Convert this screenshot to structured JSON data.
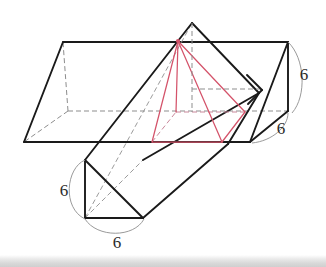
{
  "figure": {
    "colors": {
      "outline": "#1a1a1a",
      "hidden_edge": "#8d8d8d",
      "pyramid": "#d4536a",
      "pyramid_hidden": "#e7a3ae",
      "dimension_arc": "#9a9a9a",
      "label_text": "#2b2b2b",
      "background": "#ffffff",
      "bottom_bar": "#d8d8d8"
    },
    "labels": [
      {
        "id": "right-height",
        "text": "6",
        "x": 304,
        "y": 80
      },
      {
        "id": "right-depth",
        "text": "6",
        "x": 281,
        "y": 134
      },
      {
        "id": "lower-height",
        "text": "6",
        "x": 64,
        "y": 196
      },
      {
        "id": "lower-width",
        "text": "6",
        "x": 117,
        "y": 245
      }
    ],
    "prism_main": {
      "name": "horizontal-triangular-prism",
      "ridge_top_left": [
        63,
        42
      ],
      "ridge_top_right": [
        288,
        42
      ],
      "front_bottom_left": [
        24,
        142
      ],
      "front_bottom_right": [
        250,
        142
      ],
      "back_bottom_left": [
        68,
        111
      ],
      "back_bottom_right": [
        288,
        111
      ]
    },
    "prism_tilted": {
      "name": "tilted-triangular-prism",
      "apex": [
        192,
        23
      ],
      "near_top": [
        85,
        160
      ],
      "near_bottom_left": [
        85,
        218
      ],
      "near_bottom_right": [
        143,
        218
      ],
      "far_right": [
        259,
        93
      ],
      "far_bottom": [
        228,
        144
      ]
    },
    "pyramid": {
      "name": "red-square-pyramid",
      "apex": [
        178,
        41
      ],
      "base_front_left": [
        152,
        142
      ],
      "base_front_right": [
        222,
        142
      ],
      "base_back_right": [
        245,
        112
      ],
      "base_back_left": [
        176,
        112
      ]
    }
  }
}
